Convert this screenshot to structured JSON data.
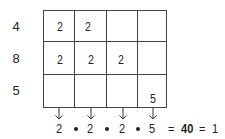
{
  "diagram": {
    "row_labels": [
      "4",
      "8",
      "5"
    ],
    "grid": {
      "rows": 3,
      "cols": 4,
      "cells": [
        [
          "2",
          "2",
          "",
          ""
        ],
        [
          "2",
          "2",
          "2",
          ""
        ],
        [
          "",
          "",
          "",
          "5"
        ]
      ]
    },
    "column_products": [
      "2",
      "2",
      "2",
      "5"
    ],
    "operator": "•",
    "equation": {
      "eq1": "=",
      "product": "40",
      "eq2": "=",
      "result": "1"
    }
  }
}
